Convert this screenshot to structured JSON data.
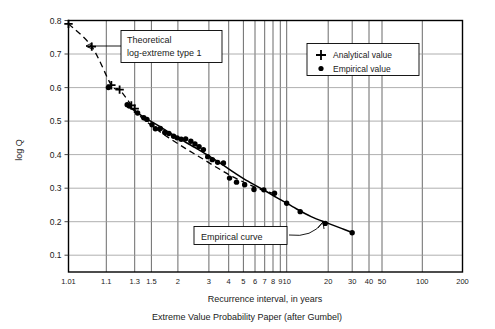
{
  "chart_data": {
    "type": "scatter",
    "title": "",
    "caption": "Extreme Value Probability Paper (after Gumbel)",
    "xlabel": "Recurrence interval, in years",
    "ylabel": "log Q",
    "xscale": "gumbel-reduced-variate",
    "xlim": [
      1.01,
      200
    ],
    "ylim": [
      0.05,
      0.8
    ],
    "grid": true,
    "xticks": [
      {
        "label": "1.01",
        "value": 1.01
      },
      {
        "label": "1.1",
        "value": 1.1
      },
      {
        "label": "1.3",
        "value": 1.3
      },
      {
        "label": "1.5",
        "value": 1.5
      },
      {
        "label": "2",
        "value": 2
      },
      {
        "label": "3",
        "value": 3
      },
      {
        "label": "4",
        "value": 4
      },
      {
        "label": "5",
        "value": 5
      },
      {
        "label": "6",
        "value": 6
      },
      {
        "label": "7",
        "value": 7
      },
      {
        "label": "8",
        "value": 8
      },
      {
        "label": "9",
        "value": 9
      },
      {
        "label": "10",
        "value": 10
      },
      {
        "label": "20",
        "value": 20
      },
      {
        "label": "30",
        "value": 30
      },
      {
        "label": "40",
        "value": 40
      },
      {
        "label": "50",
        "value": 50
      },
      {
        "label": "100",
        "value": 100
      },
      {
        "label": "200",
        "value": 200
      }
    ],
    "yticks": [
      "0.8",
      "0.7",
      "0.6",
      "0.5",
      "0.4",
      "0.3",
      "0.2",
      "0.1"
    ],
    "ytick_values": [
      0.8,
      0.7,
      0.6,
      0.5,
      0.4,
      0.3,
      0.2,
      0.1
    ],
    "legend": {
      "position": "top-right",
      "entries": [
        {
          "marker": "plus",
          "label": "Analytical value"
        },
        {
          "marker": "dot",
          "label": "Empirical value"
        }
      ]
    },
    "annotations": [
      {
        "name": "theoretical-callout",
        "lines": [
          "Theoretical",
          "log-extreme type 1"
        ],
        "points_to": "analytical-series"
      },
      {
        "name": "empirical-callout",
        "lines": [
          "Empirical curve"
        ],
        "points_to": "empirical-curve"
      }
    ],
    "series": [
      {
        "name": "Analytical value",
        "marker": "plus",
        "points": [
          {
            "x": 1.01,
            "y": 0.79
          },
          {
            "x": 1.048,
            "y": 0.722
          },
          {
            "x": 1.125,
            "y": 0.607
          },
          {
            "x": 1.175,
            "y": 0.594
          },
          {
            "x": 1.268,
            "y": 0.547
          },
          {
            "x": 1.3,
            "y": 0.537
          }
        ]
      },
      {
        "name": "Empirical value",
        "marker": "dot",
        "points": [
          {
            "x": 1.11,
            "y": 0.6
          },
          {
            "x": 1.232,
            "y": 0.549
          },
          {
            "x": 1.25,
            "y": 0.545
          },
          {
            "x": 1.33,
            "y": 0.524
          },
          {
            "x": 1.4,
            "y": 0.51
          },
          {
            "x": 1.44,
            "y": 0.505
          },
          {
            "x": 1.51,
            "y": 0.489
          },
          {
            "x": 1.56,
            "y": 0.477
          },
          {
            "x": 1.64,
            "y": 0.478
          },
          {
            "x": 1.72,
            "y": 0.466
          },
          {
            "x": 1.8,
            "y": 0.463
          },
          {
            "x": 1.9,
            "y": 0.455
          },
          {
            "x": 1.98,
            "y": 0.45
          },
          {
            "x": 2.08,
            "y": 0.446
          },
          {
            "x": 2.2,
            "y": 0.447
          },
          {
            "x": 2.35,
            "y": 0.44
          },
          {
            "x": 2.48,
            "y": 0.432
          },
          {
            "x": 2.62,
            "y": 0.424
          },
          {
            "x": 2.78,
            "y": 0.415
          },
          {
            "x": 2.95,
            "y": 0.394
          },
          {
            "x": 3.15,
            "y": 0.385
          },
          {
            "x": 3.4,
            "y": 0.377
          },
          {
            "x": 3.7,
            "y": 0.375
          },
          {
            "x": 4.05,
            "y": 0.33
          },
          {
            "x": 4.5,
            "y": 0.318
          },
          {
            "x": 5.1,
            "y": 0.31
          },
          {
            "x": 5.9,
            "y": 0.296
          },
          {
            "x": 6.9,
            "y": 0.295
          },
          {
            "x": 8.2,
            "y": 0.285
          },
          {
            "x": 10.0,
            "y": 0.255
          },
          {
            "x": 12.5,
            "y": 0.23
          },
          {
            "x": 19.0,
            "y": 0.195
          },
          {
            "x": 30.0,
            "y": 0.167
          }
        ]
      }
    ],
    "curves": [
      {
        "name": "empirical-curve",
        "style": "solid",
        "points": [
          {
            "x": 1.26,
            "y": 0.54
          },
          {
            "x": 1.4,
            "y": 0.512
          },
          {
            "x": 1.6,
            "y": 0.487
          },
          {
            "x": 1.9,
            "y": 0.458
          },
          {
            "x": 2.2,
            "y": 0.437
          },
          {
            "x": 2.6,
            "y": 0.415
          },
          {
            "x": 3.0,
            "y": 0.396
          },
          {
            "x": 3.6,
            "y": 0.372
          },
          {
            "x": 4.4,
            "y": 0.345
          },
          {
            "x": 5.4,
            "y": 0.32
          },
          {
            "x": 6.8,
            "y": 0.296
          },
          {
            "x": 8.5,
            "y": 0.272
          },
          {
            "x": 11.0,
            "y": 0.245
          },
          {
            "x": 15.0,
            "y": 0.215
          },
          {
            "x": 20.0,
            "y": 0.195
          },
          {
            "x": 25.0,
            "y": 0.18
          },
          {
            "x": 30.0,
            "y": 0.168
          }
        ]
      },
      {
        "name": "theoretical-curve",
        "style": "dashed",
        "points": [
          {
            "x": 1.01,
            "y": 0.79
          },
          {
            "x": 1.048,
            "y": 0.722
          },
          {
            "x": 1.125,
            "y": 0.607
          },
          {
            "x": 1.175,
            "y": 0.594
          },
          {
            "x": 1.268,
            "y": 0.547
          },
          {
            "x": 1.33,
            "y": 0.522
          },
          {
            "x": 1.5,
            "y": 0.487
          },
          {
            "x": 1.8,
            "y": 0.45
          },
          {
            "x": 2.2,
            "y": 0.418
          },
          {
            "x": 2.7,
            "y": 0.39
          },
          {
            "x": 3.4,
            "y": 0.36
          },
          {
            "x": 4.3,
            "y": 0.333
          },
          {
            "x": 5.5,
            "y": 0.31
          },
          {
            "x": 7.0,
            "y": 0.292
          },
          {
            "x": 8.8,
            "y": 0.28
          }
        ]
      }
    ]
  }
}
